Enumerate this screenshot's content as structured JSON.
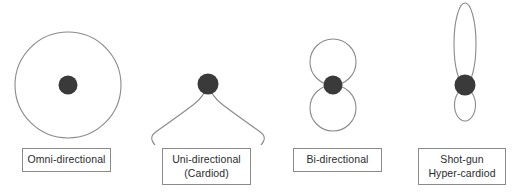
{
  "diagram": {
    "background_color": "#ffffff",
    "stroke_color": "#8a8a8a",
    "capsule_color": "#3a3a3a",
    "label_border_color": "#8a8a8a",
    "label_text_color": "#2b2b2b"
  },
  "patterns": [
    {
      "id": "omni",
      "shape": "circle",
      "label_lines": [
        "Omni-directional"
      ],
      "label_line_1": "Omni-directional",
      "label_line_2": ""
    },
    {
      "id": "uni",
      "shape": "cardioid",
      "label_lines": [
        "Uni-directional",
        "(Cardiod)"
      ],
      "label_line_1": "Uni-directional",
      "label_line_2": "(Cardiod)"
    },
    {
      "id": "bi",
      "shape": "figure-eight",
      "label_lines": [
        "Bi-directional"
      ],
      "label_line_1": "Bi-directional",
      "label_line_2": ""
    },
    {
      "id": "shotgun",
      "shape": "hyper-cardioid-lobe",
      "label_lines": [
        "Shot-gun",
        "Hyper-cardiod"
      ],
      "label_line_1": "Shot-gun",
      "label_line_2": "Hyper-cardiod"
    }
  ]
}
